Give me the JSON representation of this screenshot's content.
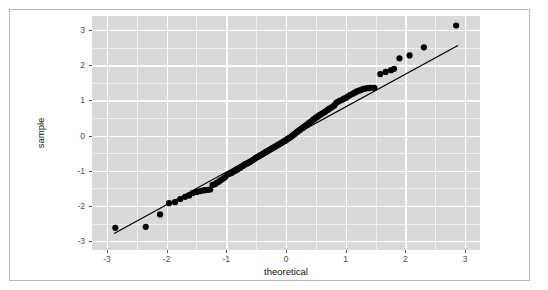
{
  "chart_data": {
    "type": "scatter",
    "title": "",
    "subtitle": "",
    "xlabel": "theoretical",
    "ylabel": "sample",
    "xlim": [
      -3.25,
      3.25
    ],
    "ylim": [
      -3.25,
      3.4
    ],
    "grid": true,
    "legend": null,
    "legend_position": "none",
    "panel_background": "#d9d9d9",
    "grid_color": "#ffffff",
    "point_color": "#000000",
    "line_color": "#000000",
    "xticks": [
      -3,
      -2,
      -1,
      0,
      1,
      2,
      3
    ],
    "xtick_labels": [
      "-3",
      "-2",
      "-1",
      "0",
      "1",
      "2",
      "3"
    ],
    "yticks": [
      -3,
      -2,
      -1,
      0,
      1,
      2,
      3
    ],
    "ytick_labels": [
      "-3",
      "-2",
      "-1",
      "0",
      "1",
      "2",
      "3"
    ],
    "xminor": [
      -2.5,
      -1.5,
      -0.5,
      0.5,
      1.5,
      2.5
    ],
    "yminor": [
      -2.5,
      -1.5,
      -0.5,
      0.5,
      1.5,
      2.5,
      3.5
    ],
    "reference_line": {
      "name": "qq-reference-line",
      "x0": -2.88,
      "y0": -2.78,
      "x1": 2.88,
      "y1": 2.56
    },
    "series": [
      {
        "name": "sample quantiles",
        "marker": "circle",
        "marker_size": 3.1,
        "color": "#000000",
        "points": [
          [
            -2.86,
            -2.62
          ],
          [
            -2.35,
            -2.59
          ],
          [
            -2.11,
            -2.24
          ],
          [
            -1.96,
            -1.92
          ],
          [
            -1.86,
            -1.89
          ],
          [
            -1.77,
            -1.8
          ],
          [
            -1.69,
            -1.74
          ],
          [
            -1.62,
            -1.7
          ],
          [
            -1.56,
            -1.63
          ],
          [
            -1.5,
            -1.6
          ],
          [
            -1.45,
            -1.58
          ],
          [
            -1.4,
            -1.56
          ],
          [
            -1.36,
            -1.55
          ],
          [
            -1.31,
            -1.54
          ],
          [
            -1.27,
            -1.53
          ],
          [
            -1.23,
            -1.4
          ],
          [
            -1.19,
            -1.38
          ],
          [
            -1.16,
            -1.34
          ],
          [
            -1.12,
            -1.3
          ],
          [
            -1.09,
            -1.26
          ],
          [
            -1.05,
            -1.22
          ],
          [
            -1.02,
            -1.18
          ],
          [
            -0.99,
            -1.12
          ],
          [
            -0.96,
            -1.09
          ],
          [
            -0.93,
            -1.07
          ],
          [
            -0.9,
            -1.05
          ],
          [
            -0.88,
            -1.02
          ],
          [
            -0.85,
            -1.0
          ],
          [
            -0.82,
            -0.97
          ],
          [
            -0.8,
            -0.94
          ],
          [
            -0.77,
            -0.92
          ],
          [
            -0.75,
            -0.89
          ],
          [
            -0.72,
            -0.86
          ],
          [
            -0.7,
            -0.83
          ],
          [
            -0.68,
            -0.81
          ],
          [
            -0.65,
            -0.79
          ],
          [
            -0.63,
            -0.77
          ],
          [
            -0.61,
            -0.75
          ],
          [
            -0.59,
            -0.73
          ],
          [
            -0.56,
            -0.7
          ],
          [
            -0.54,
            -0.68
          ],
          [
            -0.52,
            -0.65
          ],
          [
            -0.5,
            -0.63
          ],
          [
            -0.48,
            -0.61
          ],
          [
            -0.46,
            -0.59
          ],
          [
            -0.44,
            -0.57
          ],
          [
            -0.42,
            -0.55
          ],
          [
            -0.4,
            -0.53
          ],
          [
            -0.38,
            -0.51
          ],
          [
            -0.36,
            -0.49
          ],
          [
            -0.34,
            -0.47
          ],
          [
            -0.32,
            -0.45
          ],
          [
            -0.3,
            -0.43
          ],
          [
            -0.28,
            -0.41
          ],
          [
            -0.26,
            -0.39
          ],
          [
            -0.24,
            -0.37
          ],
          [
            -0.22,
            -0.35
          ],
          [
            -0.2,
            -0.33
          ],
          [
            -0.18,
            -0.31
          ],
          [
            -0.16,
            -0.29
          ],
          [
            -0.14,
            -0.27
          ],
          [
            -0.12,
            -0.25
          ],
          [
            -0.1,
            -0.23
          ],
          [
            -0.08,
            -0.21
          ],
          [
            -0.06,
            -0.19
          ],
          [
            -0.04,
            -0.17
          ],
          [
            -0.02,
            -0.15
          ],
          [
            0.0,
            -0.13
          ],
          [
            0.02,
            -0.1
          ],
          [
            0.04,
            -0.08
          ],
          [
            0.06,
            -0.06
          ],
          [
            0.08,
            -0.04
          ],
          [
            0.1,
            -0.01
          ],
          [
            0.12,
            0.02
          ],
          [
            0.14,
            0.04
          ],
          [
            0.16,
            0.07
          ],
          [
            0.18,
            0.1
          ],
          [
            0.2,
            0.12
          ],
          [
            0.22,
            0.15
          ],
          [
            0.24,
            0.17
          ],
          [
            0.26,
            0.2
          ],
          [
            0.28,
            0.22
          ],
          [
            0.3,
            0.25
          ],
          [
            0.32,
            0.27
          ],
          [
            0.34,
            0.3
          ],
          [
            0.36,
            0.32
          ],
          [
            0.38,
            0.35
          ],
          [
            0.4,
            0.38
          ],
          [
            0.42,
            0.4
          ],
          [
            0.44,
            0.43
          ],
          [
            0.46,
            0.46
          ],
          [
            0.48,
            0.48
          ],
          [
            0.5,
            0.51
          ],
          [
            0.53,
            0.54
          ],
          [
            0.55,
            0.57
          ],
          [
            0.57,
            0.59
          ],
          [
            0.6,
            0.62
          ],
          [
            0.62,
            0.64
          ],
          [
            0.65,
            0.67
          ],
          [
            0.67,
            0.7
          ],
          [
            0.7,
            0.73
          ],
          [
            0.72,
            0.76
          ],
          [
            0.75,
            0.79
          ],
          [
            0.78,
            0.82
          ],
          [
            0.81,
            0.86
          ],
          [
            0.84,
            0.93
          ],
          [
            0.87,
            0.96
          ],
          [
            0.9,
            0.99
          ],
          [
            0.94,
            1.02
          ],
          [
            0.97,
            1.05
          ],
          [
            1.01,
            1.08
          ],
          [
            1.04,
            1.12
          ],
          [
            1.08,
            1.16
          ],
          [
            1.12,
            1.19
          ],
          [
            1.15,
            1.22
          ],
          [
            1.18,
            1.25
          ],
          [
            1.21,
            1.27
          ],
          [
            1.24,
            1.29
          ],
          [
            1.27,
            1.31
          ],
          [
            1.3,
            1.33
          ],
          [
            1.33,
            1.34
          ],
          [
            1.37,
            1.35
          ],
          [
            1.42,
            1.36
          ],
          [
            1.48,
            1.36
          ],
          [
            1.58,
            1.75
          ],
          [
            1.67,
            1.81
          ],
          [
            1.76,
            1.86
          ],
          [
            1.81,
            1.9
          ],
          [
            1.9,
            2.2
          ],
          [
            2.07,
            2.28
          ],
          [
            2.31,
            2.51
          ],
          [
            2.85,
            3.13
          ]
        ]
      }
    ]
  },
  "figure": {
    "x_axis_title": "theoretical",
    "y_axis_title": "sample",
    "x_tick_labels": [
      "-3",
      "-2",
      "-1",
      "0",
      "1",
      "2",
      "3"
    ],
    "y_tick_labels": [
      "3",
      "2",
      "1",
      "0",
      "-1",
      "-2",
      "-3"
    ]
  }
}
